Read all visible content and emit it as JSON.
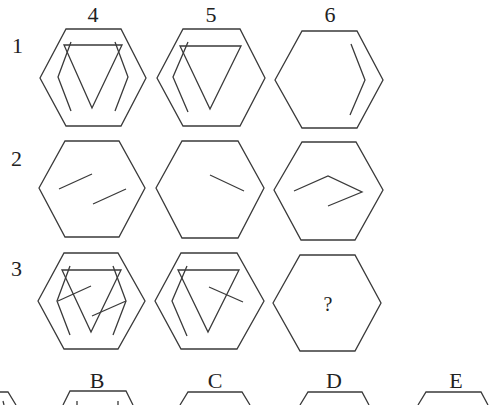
{
  "puzzle": {
    "column_labels": [
      "4",
      "5",
      "6"
    ],
    "row_labels": [
      "1",
      "2",
      "3"
    ],
    "missing_cell_mark": "?",
    "option_labels": [
      "B",
      "C",
      "D",
      "E"
    ],
    "line_color": "#3a3a3a",
    "background_color": "#ffffff"
  },
  "grid": {
    "rows": [
      {
        "label": "1",
        "cells": [
          {
            "col": "4",
            "contents": [
              "outer-hexagon",
              "inverted-triangle",
              "left-bracket",
              "right-bracket"
            ]
          },
          {
            "col": "5",
            "contents": [
              "outer-hexagon",
              "inverted-triangle",
              "left-bracket"
            ]
          },
          {
            "col": "6",
            "contents": [
              "outer-hexagon",
              "right-bracket"
            ]
          }
        ]
      },
      {
        "label": "2",
        "cells": [
          {
            "col": "4",
            "contents": [
              "outer-hexagon",
              "two-parallel-slashes"
            ]
          },
          {
            "col": "5",
            "contents": [
              "outer-hexagon",
              "one-descending-segment"
            ]
          },
          {
            "col": "6",
            "contents": [
              "outer-hexagon",
              "zigzag-arrow-polyline"
            ]
          }
        ]
      },
      {
        "label": "3",
        "cells": [
          {
            "col": "4",
            "contents": [
              "outer-hexagon",
              "inverted-triangle",
              "left-bracket",
              "right-bracket",
              "two-parallel-slashes"
            ]
          },
          {
            "col": "5",
            "contents": [
              "outer-hexagon",
              "inverted-triangle",
              "left-bracket",
              "one-descending-segment"
            ]
          },
          {
            "col": "6",
            "contents": [
              "outer-hexagon",
              "question-mark"
            ]
          }
        ]
      }
    ]
  }
}
